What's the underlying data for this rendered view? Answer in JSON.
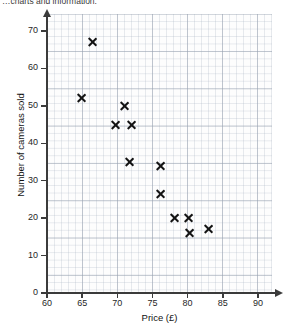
{
  "intro_text": "…charts and information.",
  "chart_data": {
    "type": "scatter",
    "title": "",
    "xlabel": "Price (£)",
    "ylabel": "Number of cameras sold",
    "xlim": [
      60,
      92
    ],
    "ylim": [
      0,
      74
    ],
    "xticks": [
      60,
      65,
      70,
      75,
      80,
      85,
      90
    ],
    "yticks": [
      0,
      10,
      20,
      30,
      40,
      50,
      60,
      70
    ],
    "grid": true,
    "grid_minor": true,
    "legend": null,
    "marker": "x",
    "marker_color": "#141414",
    "points": [
      {
        "x": 66.5,
        "y": 67
      },
      {
        "x": 65.0,
        "y": 52
      },
      {
        "x": 71.0,
        "y": 50
      },
      {
        "x": 69.7,
        "y": 45
      },
      {
        "x": 72.0,
        "y": 45
      },
      {
        "x": 71.7,
        "y": 35
      },
      {
        "x": 76.1,
        "y": 34
      },
      {
        "x": 76.1,
        "y": 26.5
      },
      {
        "x": 78.2,
        "y": 20
      },
      {
        "x": 80.1,
        "y": 20
      },
      {
        "x": 80.3,
        "y": 16
      },
      {
        "x": 83.0,
        "y": 17
      }
    ]
  },
  "axis": {
    "x_tick_labels": [
      "60",
      "65",
      "70",
      "75",
      "80",
      "85",
      "90"
    ],
    "y_tick_labels": [
      "0",
      "10",
      "20",
      "30",
      "40",
      "50",
      "60",
      "70"
    ],
    "x_title": "Price (£)",
    "y_title": "Number of cameras sold"
  },
  "colors": {
    "marker": "#141414",
    "axis": "#3b3b3b",
    "grid_major": "#96a0af",
    "grid_minor": "#aab4c3",
    "plot_background": "#fdfdfd"
  }
}
